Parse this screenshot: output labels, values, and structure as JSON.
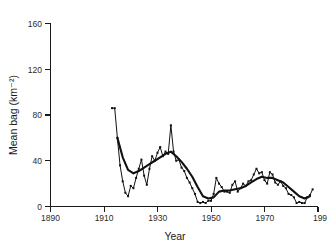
{
  "chart_data": {
    "type": "line",
    "title": "",
    "xlabel": "Year",
    "ylabel": "Mean bag (km⁻²)",
    "xlim": [
      1890,
      1990
    ],
    "ylim": [
      0,
      160
    ],
    "xticks": [
      1890,
      1910,
      1930,
      1950,
      1970,
      1990
    ],
    "xticklabels": [
      "1890",
      "1910",
      "1930",
      "1950",
      "1970",
      "199"
    ],
    "yticks": [
      0,
      40,
      80,
      120,
      160
    ],
    "yticklabels": [
      "0",
      "40",
      "80",
      "120",
      "160"
    ],
    "grid": false,
    "legend": "none",
    "series": [
      {
        "name": "Annual mean bag",
        "style": "thin-line-with-markers",
        "x": [
          1913,
          1914,
          1915,
          1916,
          1917,
          1918,
          1919,
          1920,
          1921,
          1922,
          1923,
          1924,
          1925,
          1926,
          1927,
          1928,
          1929,
          1930,
          1931,
          1932,
          1933,
          1934,
          1935,
          1936,
          1937,
          1938,
          1939,
          1940,
          1941,
          1942,
          1943,
          1944,
          1945,
          1946,
          1947,
          1948,
          1949,
          1950,
          1951,
          1952,
          1953,
          1954,
          1955,
          1956,
          1957,
          1958,
          1959,
          1960,
          1961,
          1962,
          1963,
          1964,
          1965,
          1966,
          1967,
          1968,
          1969,
          1970,
          1971,
          1972,
          1973,
          1974,
          1975,
          1976,
          1977,
          1978,
          1979,
          1980,
          1981,
          1982,
          1983,
          1984,
          1985,
          1986,
          1987,
          1988
        ],
        "y": [
          86,
          86,
          60,
          36,
          22,
          12,
          9,
          18,
          16,
          25,
          33,
          41,
          27,
          19,
          33,
          44,
          40,
          47,
          52,
          44,
          48,
          46,
          71,
          48,
          40,
          41,
          34,
          31,
          25,
          21,
          16,
          11,
          4,
          3,
          4,
          3,
          5,
          5,
          11,
          25,
          20,
          17,
          13,
          13,
          12,
          19,
          22,
          13,
          16,
          20,
          18,
          22,
          23,
          28,
          33,
          29,
          30,
          23,
          20,
          30,
          28,
          21,
          19,
          22,
          18,
          16,
          11,
          10,
          8,
          3,
          4,
          3,
          3,
          8,
          10,
          15
        ]
      },
      {
        "name": "Smoothed trend",
        "style": "thick-line",
        "x": [
          1915,
          1917,
          1919,
          1921,
          1923,
          1925,
          1927,
          1929,
          1931,
          1933,
          1935,
          1937,
          1939,
          1941,
          1943,
          1945,
          1947,
          1949,
          1951,
          1953,
          1955,
          1957,
          1959,
          1961,
          1963,
          1965,
          1967,
          1969,
          1971,
          1973,
          1975,
          1977,
          1979,
          1981,
          1983,
          1985,
          1987
        ],
        "y": [
          60,
          43,
          32,
          29,
          31,
          34,
          37,
          40,
          43,
          46,
          48,
          44,
          39,
          33,
          26,
          17,
          9,
          7,
          8,
          13,
          14,
          14,
          15,
          16,
          18,
          21,
          24,
          26,
          25,
          25,
          23,
          21,
          17,
          13,
          9,
          7,
          9
        ]
      }
    ]
  },
  "axes": {
    "y_tick_label_anchor": "end",
    "x_tick_label_anchor": "middle"
  }
}
